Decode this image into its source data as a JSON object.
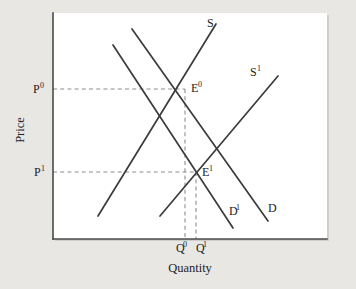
{
  "figure": {
    "type": "economics-supply-demand-diagram",
    "background_color": "#e9e7e4",
    "plot_background_color": "#ffffff",
    "axis_color": "#4a4a4a",
    "curve_color": "#3b3b3b",
    "dash_color": "#8e8e8e"
  },
  "axes": {
    "x_title": "Quantity",
    "y_title": "Price",
    "x_axis": {
      "x1": 53,
      "y1": 239,
      "x2": 327,
      "y2": 239
    },
    "y_axis": {
      "x1": 53,
      "y1": 13,
      "x2": 53,
      "y2": 239
    },
    "plot_rect": {
      "x": 53,
      "y": 13,
      "width": 274,
      "height": 226
    }
  },
  "curves": [
    {
      "name": "S",
      "label": "S",
      "label_sup": "",
      "label_x": 207,
      "label_y": 27,
      "x1": 98,
      "y1": 216,
      "x2": 216,
      "y2": 24,
      "kind": "supply"
    },
    {
      "name": "S1",
      "label": "S",
      "label_sup": "1",
      "label_x": 250,
      "label_y": 76,
      "x1": 160,
      "y1": 216,
      "x2": 278,
      "y2": 76,
      "kind": "supply"
    },
    {
      "name": "D",
      "label": "D",
      "label_sup": "",
      "label_x": 268,
      "label_y": 212,
      "x1": 132,
      "y1": 29,
      "x2": 268,
      "y2": 221,
      "kind": "demand"
    },
    {
      "name": "D1",
      "label": "D",
      "label_sup": "1",
      "label_x": 229,
      "label_y": 215,
      "x1": 113,
      "y1": 45,
      "x2": 233,
      "y2": 228,
      "kind": "demand"
    }
  ],
  "equilibria": [
    {
      "name": "E0",
      "label": "E",
      "label_sup": "0",
      "x": 185,
      "y": 89,
      "label_x": 191,
      "label_y": 92
    },
    {
      "name": "E1",
      "label": "E",
      "label_sup": "1",
      "x": 196,
      "y": 172,
      "label_x": 202,
      "label_y": 176
    }
  ],
  "price_ticks": [
    {
      "name": "P0",
      "label": "P",
      "label_sup": "0",
      "y": 89,
      "label_x": 33,
      "label_y": 93,
      "dash_x1": 53,
      "dash_x2": 185
    },
    {
      "name": "P1",
      "label": "P",
      "label_sup": "1",
      "y": 172,
      "label_x": 34,
      "label_y": 176,
      "dash_x1": 53,
      "dash_x2": 196
    }
  ],
  "quantity_ticks": [
    {
      "name": "Q0",
      "label": "Q",
      "label_sup": "0",
      "x": 185,
      "label_x": 176,
      "label_y": 252,
      "dash_y1": 89,
      "dash_y2": 239
    },
    {
      "name": "Q1",
      "label": "Q",
      "label_sup": "1",
      "x": 196,
      "label_x": 196,
      "label_y": 252,
      "dash_y1": 172,
      "dash_y2": 239
    }
  ],
  "titles": {
    "x_title_x": 190,
    "x_title_y": 272,
    "y_title_x": 24,
    "y_title_y": 130
  }
}
